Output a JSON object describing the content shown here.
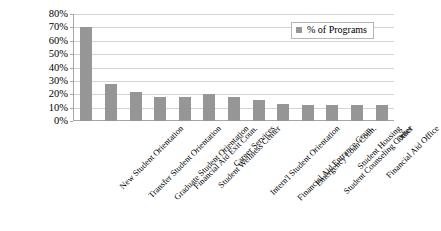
{
  "chart_data": {
    "type": "bar",
    "title": "",
    "xlabel": "",
    "ylabel": "",
    "ylim": [
      0,
      0.8
    ],
    "grid": true,
    "legend_position": "top-right",
    "y_ticks": [
      "0%",
      "10%",
      "20%",
      "30%",
      "40%",
      "50%",
      "60%",
      "70%",
      "80%"
    ],
    "y_tick_values": [
      0,
      0.1,
      0.2,
      0.3,
      0.4,
      0.5,
      0.6,
      0.7,
      0.8
    ],
    "categories": [
      "New Student Orientation",
      "Transfer Student Orientation",
      "Graduate Student Orientation",
      "Financial Aid Exit Coun.",
      "Student Wellness Center",
      "Career Services",
      "Intern'l Student Orientation",
      "Financial Aid Entrance Coun.",
      "Emergency Loan Coun.",
      "Student Counseling Center",
      "Student Housing",
      "Financial Aid Office",
      "Other"
    ],
    "series": [
      {
        "name": "% of Programs",
        "color": "#969696",
        "values": [
          0.7,
          0.28,
          0.22,
          0.18,
          0.18,
          0.2,
          0.18,
          0.155,
          0.125,
          0.12,
          0.12,
          0.12,
          0.12
        ]
      }
    ]
  },
  "legend": {
    "label": "% of Programs",
    "swatch_color": "#969696"
  }
}
